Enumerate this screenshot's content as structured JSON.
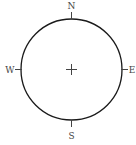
{
  "diagram": {
    "type": "compass-rose",
    "directions": {
      "north": "N",
      "east": "E",
      "south": "S",
      "west": "W"
    },
    "center_marker": "+",
    "colors": {
      "circle": "#1a1a1a",
      "ticks": "#444444",
      "labels": "#444444",
      "background": "#ffffff"
    }
  }
}
